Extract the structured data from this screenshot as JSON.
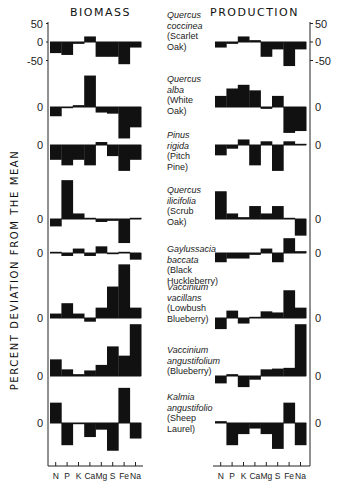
{
  "titles": {
    "left": "BIOMASS",
    "right": "PRODUCTION"
  },
  "ylabel": "PERCENT DEVIATION FROM THE MEAN",
  "xcategories": [
    "N",
    "P",
    "K",
    "Ca",
    "Mg",
    "S",
    "Fe",
    "Na"
  ],
  "scale_ticks": {
    "top": "50",
    "zero": "0",
    "bottom": "-50"
  },
  "species": [
    {
      "latin": "Quercus coccinea",
      "latin_l1": "Quercus",
      "latin_l2": "coccinea",
      "common_l1": "(Scarlet",
      "common_l2": "Oak)"
    },
    {
      "latin": "Quercus alba",
      "latin_l1": "Quercus",
      "latin_l2": "alba",
      "common_l1": "(White",
      "common_l2": "Oak)"
    },
    {
      "latin": "Pinus rigida",
      "latin_l1": "Pinus",
      "latin_l2": "rigida",
      "common_l1": "(Pitch",
      "common_l2": "Pine)"
    },
    {
      "latin": "Quercus ilicifolia",
      "latin_l1": "Quercus",
      "latin_l2": "ilicifolia",
      "common_l1": "(Scrub",
      "common_l2": "Oak)"
    },
    {
      "latin": "Gaylussacia baccata",
      "latin_l1": "Gaylussacia",
      "latin_l2": "baccata",
      "common_l1": "(Black",
      "common_l2": "Huckleberry)"
    },
    {
      "latin": "Vaccinium vacillans",
      "latin_l1": "Vaccinium",
      "latin_l2": "vacillans",
      "common_l1": "(Lowbush",
      "common_l2": "Blueberry)"
    },
    {
      "latin": "Vaccinium angustifolium",
      "latin_l1": "Vaccinium",
      "latin_l2": "angustifolium",
      "common_l1": "(Blueberry)",
      "common_l2": ""
    },
    {
      "latin": "Kalmia angustifolio",
      "latin_l1": "Kalmia",
      "latin_l2": "angustifolio",
      "common_l1": "(Sheep",
      "common_l2": "Laurel)"
    }
  ],
  "chart_data": {
    "type": "bar",
    "ylabel": "PERCENT DEVIATION FROM THE MEAN",
    "xlabel": "",
    "categories": [
      "N",
      "P",
      "K",
      "Ca",
      "Mg",
      "S",
      "Fe",
      "Na"
    ],
    "scale": {
      "ticks": [
        50,
        0,
        -50
      ]
    },
    "panels": [
      {
        "name": "BIOMASS",
        "series": [
          {
            "name": "Quercus coccinea (Scarlet Oak)",
            "values": [
              -30,
              -35,
              -5,
              15,
              -40,
              -40,
              -60,
              -15
            ]
          },
          {
            "name": "Quercus alba (White Oak)",
            "values": [
              -25,
              -3,
              5,
              85,
              -15,
              -18,
              -85,
              -55
            ]
          },
          {
            "name": "Pinus rigida (Pitch Pine)",
            "values": [
              -40,
              -55,
              -40,
              -55,
              8,
              -30,
              -70,
              -40
            ]
          },
          {
            "name": "Quercus ilicifolia (Scrub Oak)",
            "values": [
              -20,
              105,
              15,
              3,
              -8,
              -5,
              -65,
              3
            ]
          },
          {
            "name": "Gaylussacia baccata (Black Huckleberry)",
            "values": [
              3,
              -8,
              12,
              -8,
              18,
              -3,
              0,
              -18
            ]
          },
          {
            "name": "Vaccinium vacillans (Lowbush Blueberry)",
            "values": [
              12,
              40,
              12,
              -10,
              28,
              85,
              145,
              28
            ]
          },
          {
            "name": "Vaccinium angustifolium (Blueberry)",
            "values": [
              45,
              18,
              5,
              15,
              30,
              80,
              55,
              140
            ]
          },
          {
            "name": "Kalmia angustifolio (Sheep Laurel)",
            "values": [
              55,
              -60,
              -3,
              -38,
              -18,
              -75,
              95,
              -42
            ]
          }
        ]
      },
      {
        "name": "PRODUCTION",
        "series": [
          {
            "name": "Quercus coccinea (Scarlet Oak)",
            "values": [
              -15,
              -5,
              15,
              5,
              -40,
              -20,
              -65,
              -20
            ]
          },
          {
            "name": "Quercus alba (White Oak)",
            "values": [
              30,
              50,
              60,
              45,
              -5,
              30,
              -70,
              -65
            ]
          },
          {
            "name": "Pinus rigida (Pitch Pine)",
            "values": [
              -28,
              -10,
              15,
              -55,
              10,
              -70,
              10,
              0
            ]
          },
          {
            "name": "Quercus ilicifolia (Scrub Oak)",
            "values": [
              75,
              15,
              5,
              35,
              15,
              35,
              3,
              -45
            ]
          },
          {
            "name": "Gaylussacia baccata (Black Huckleberry)",
            "values": [
              -25,
              -15,
              -15,
              -5,
              12,
              -25,
              40,
              5
            ]
          },
          {
            "name": "Vaccinium vacillans (Lowbush Blueberry)",
            "values": [
              -30,
              20,
              -15,
              0,
              18,
              15,
              75,
              28
            ]
          },
          {
            "name": "Vaccinium angustifolium (Blueberry)",
            "values": [
              -20,
              5,
              -30,
              -10,
              18,
              20,
              22,
              140
            ]
          },
          {
            "name": "Kalmia angustifolio (Sheep Laurel)",
            "values": [
              5,
              -60,
              -30,
              -15,
              -30,
              -70,
              55,
              -60
            ]
          }
        ]
      }
    ],
    "zero_baselines_px": [
      42,
      107,
      145,
      219,
      253,
      318,
      376,
      423
    ]
  }
}
